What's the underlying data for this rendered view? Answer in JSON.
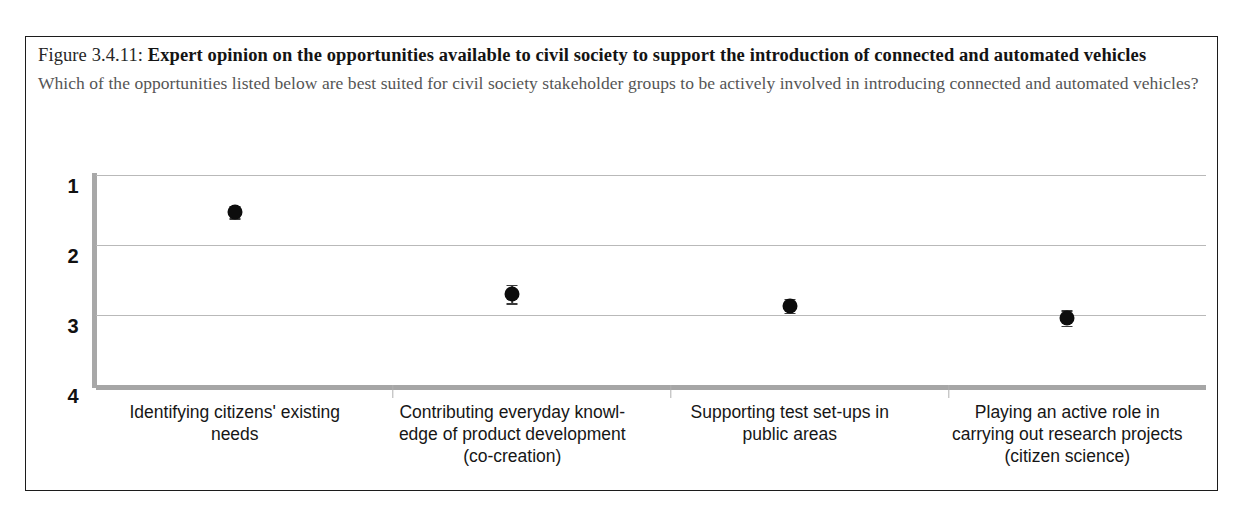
{
  "figure": {
    "number": "Figure 3.4.11:",
    "title": "Expert opinion on the opportunities available to civil society to support the introduction of connected and automated vehicles",
    "question": "Which of the opportunities listed below are best suited for civil society stakeholder groups to be actively involved in introducing connected and automated vehicles?"
  },
  "colors": {
    "marker": "#0d0d0d",
    "gridline": "#b9b9b9",
    "axis": "#a8a8a8",
    "border": "#1c1c1c",
    "question_text": "#555555"
  },
  "chart_data": {
    "type": "scatter",
    "title": "Expert opinion on the opportunities available to civil society to support the introduction of connected and automated vehicles",
    "xlabel": "",
    "ylabel": "",
    "ylim": [
      1,
      4
    ],
    "y_inverted": true,
    "yticks": [
      "1",
      "2",
      "3",
      "4"
    ],
    "ytick_values": [
      1,
      2,
      3,
      4
    ],
    "grid": true,
    "legend": "none",
    "error_bars": true,
    "categories": [
      "Identifying citizens' existing needs",
      "Contributing everyday knowledge of product development (co-creation)",
      "Supporting test set-ups in public areas",
      "Playing an active role in carrying out research projects (citizen science)"
    ],
    "category_label_lines": [
      [
        "Identifying citizens' existing",
        "needs"
      ],
      [
        "Contributing everyday knowl-",
        "edge of product development",
        "(co-creation)"
      ],
      [
        "Supporting test set-ups in",
        "public areas"
      ],
      [
        "Playing an active role in",
        "carrying out research projects",
        "(citizen science)"
      ]
    ],
    "values": [
      1.53,
      2.7,
      2.87,
      3.04
    ],
    "errors": [
      0.09,
      0.13,
      0.1,
      0.11
    ]
  }
}
